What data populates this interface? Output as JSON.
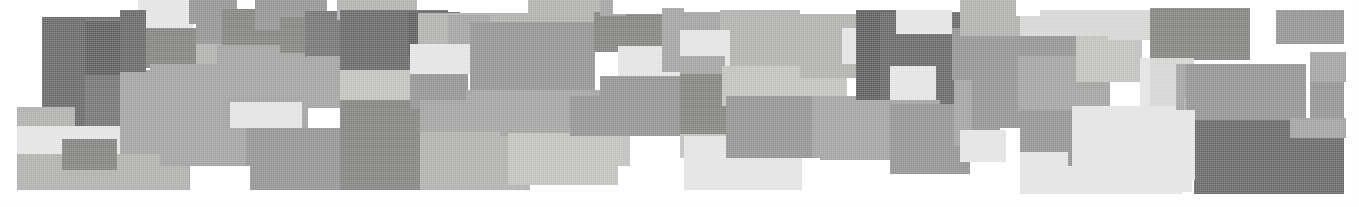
{
  "image": {
    "title": "Abstract grayscale rectangle mosaic band",
    "width": 1359,
    "height": 207,
    "background_color": "#ffffff",
    "description": "Horizontal band composed of overlapping solid grayscale rectangles of varying tone, resembling a scanned halftone pixel-mosaic graphic."
  },
  "palette": {
    "white": "#ffffff",
    "near_white": "#ececeb",
    "very_light_gray": "#e2e2e1",
    "light_gray": "#d3d3d2",
    "mid_light_gray": "#bdbdbc",
    "mid_gray": "#acacab",
    "gray": "#9d9d9c",
    "mid_dark_gray": "#8e8e8d",
    "dark_gray": "#7d7d7c",
    "darker_gray": "#6e6e6d",
    "very_dark_gray": "#626261",
    "charcoal": "#575756"
  },
  "blocks": [
    {
      "name": "block-01",
      "x": 42,
      "y": 17,
      "w": 78,
      "h": 122,
      "fill": "#626261"
    },
    {
      "name": "block-02",
      "x": 85,
      "y": 19,
      "w": 54,
      "h": 145,
      "fill": "#6e6e6d"
    },
    {
      "name": "block-03",
      "x": 85,
      "y": 21,
      "w": 53,
      "h": 54,
      "fill": "#575756"
    },
    {
      "name": "block-04",
      "x": 138,
      "y": 0,
      "w": 55,
      "h": 30,
      "fill": "#e2e2e1"
    },
    {
      "name": "block-05",
      "x": 138,
      "y": 28,
      "w": 78,
      "h": 40,
      "fill": "#7d7d7c"
    },
    {
      "name": "block-06",
      "x": 196,
      "y": 14,
      "w": 66,
      "h": 33,
      "fill": "#8e8e8d"
    },
    {
      "name": "block-07",
      "x": 196,
      "y": 44,
      "w": 122,
      "h": 62,
      "fill": "#acacab"
    },
    {
      "name": "block-08",
      "x": 17,
      "y": 107,
      "w": 58,
      "h": 46,
      "fill": "#acacab"
    },
    {
      "name": "block-09",
      "x": 17,
      "y": 126,
      "w": 118,
      "h": 48,
      "fill": "#e2e2e1"
    },
    {
      "name": "block-10",
      "x": 17,
      "y": 154,
      "w": 100,
      "h": 36,
      "fill": "#acacab"
    },
    {
      "name": "block-11",
      "x": 62,
      "y": 139,
      "w": 55,
      "h": 31,
      "fill": "#7d7d7c"
    },
    {
      "name": "block-12",
      "x": 120,
      "y": 70,
      "w": 79,
      "h": 95,
      "fill": "#9d9d9c"
    },
    {
      "name": "block-13",
      "x": 117,
      "y": 154,
      "w": 72,
      "h": 36,
      "fill": "#acacab"
    },
    {
      "name": "block-14",
      "x": 189,
      "y": 0,
      "w": 48,
      "h": 24,
      "fill": "#8e8e8d"
    },
    {
      "name": "block-15",
      "x": 222,
      "y": 9,
      "w": 66,
      "h": 36,
      "fill": "#7d7d7c"
    },
    {
      "name": "block-16",
      "x": 217,
      "y": 45,
      "w": 90,
      "h": 63,
      "fill": "#9d9d9c"
    },
    {
      "name": "block-17",
      "x": 160,
      "y": 96,
      "w": 148,
      "h": 70,
      "fill": "#9d9d9c"
    },
    {
      "name": "block-18",
      "x": 189,
      "y": 130,
      "w": 72,
      "h": 60,
      "fill": "#9d9d9c"
    },
    {
      "name": "block-19",
      "x": 230,
      "y": 102,
      "w": 72,
      "h": 26,
      "fill": "#e2e2e1"
    },
    {
      "name": "block-20",
      "x": 246,
      "y": 128,
      "w": 120,
      "h": 62,
      "fill": "#8e8e8d"
    },
    {
      "name": "block-21",
      "x": 190,
      "y": 166,
      "w": 60,
      "h": 24,
      "fill": "#ffffff"
    },
    {
      "name": "block-22",
      "x": 255,
      "y": 0,
      "w": 72,
      "h": 30,
      "fill": "#8e8e8d"
    },
    {
      "name": "block-23",
      "x": 280,
      "y": 17,
      "w": 66,
      "h": 36,
      "fill": "#7d7d7c"
    },
    {
      "name": "block-24",
      "x": 305,
      "y": 11,
      "w": 80,
      "h": 46,
      "fill": "#6e6e6d"
    },
    {
      "name": "block-25",
      "x": 307,
      "y": 56,
      "w": 110,
      "h": 52,
      "fill": "#9d9d9c"
    },
    {
      "name": "block-26",
      "x": 337,
      "y": 0,
      "w": 80,
      "h": 20,
      "fill": "#acacab"
    },
    {
      "name": "block-27",
      "x": 340,
      "y": 10,
      "w": 108,
      "h": 62,
      "fill": "#626261"
    },
    {
      "name": "block-28",
      "x": 408,
      "y": 12,
      "w": 52,
      "h": 44,
      "fill": "#575756"
    },
    {
      "name": "block-29",
      "x": 340,
      "y": 70,
      "w": 78,
      "h": 30,
      "fill": "#bdbdbc"
    },
    {
      "name": "block-30",
      "x": 340,
      "y": 100,
      "w": 80,
      "h": 90,
      "fill": "#7d7d7c"
    },
    {
      "name": "block-31",
      "x": 418,
      "y": 13,
      "w": 110,
      "h": 58,
      "fill": "#acacab"
    },
    {
      "name": "block-32",
      "x": 448,
      "y": 15,
      "w": 42,
      "h": 30,
      "fill": "#9d9d9c"
    },
    {
      "name": "block-33",
      "x": 410,
      "y": 44,
      "w": 70,
      "h": 30,
      "fill": "#e2e2e1"
    },
    {
      "name": "block-34",
      "x": 410,
      "y": 74,
      "w": 58,
      "h": 35,
      "fill": "#8e8e8d"
    },
    {
      "name": "block-35",
      "x": 420,
      "y": 100,
      "w": 150,
      "h": 36,
      "fill": "#9d9d9c"
    },
    {
      "name": "block-36",
      "x": 420,
      "y": 132,
      "w": 110,
      "h": 58,
      "fill": "#acacab"
    },
    {
      "name": "block-37",
      "x": 470,
      "y": 22,
      "w": 125,
      "h": 70,
      "fill": "#8e8e8d"
    },
    {
      "name": "block-38",
      "x": 500,
      "y": 90,
      "w": 112,
      "h": 46,
      "fill": "#9d9d9c"
    },
    {
      "name": "block-39",
      "x": 508,
      "y": 133,
      "w": 110,
      "h": 52,
      "fill": "#bdbdbc"
    },
    {
      "name": "block-40",
      "x": 528,
      "y": 0,
      "w": 86,
      "h": 22,
      "fill": "#acacab"
    },
    {
      "name": "block-41",
      "x": 594,
      "y": 12,
      "w": 70,
      "h": 40,
      "fill": "#7d7d7c"
    },
    {
      "name": "block-42",
      "x": 600,
      "y": 0,
      "w": 26,
      "h": 16,
      "fill": "#9d9d9c"
    },
    {
      "name": "block-43",
      "x": 613,
      "y": 0,
      "w": 52,
      "h": 14,
      "fill": "#ffffff"
    },
    {
      "name": "block-44",
      "x": 618,
      "y": 46,
      "w": 70,
      "h": 32,
      "fill": "#e2e2e1"
    },
    {
      "name": "block-45",
      "x": 600,
      "y": 76,
      "w": 125,
      "h": 60,
      "fill": "#8e8e8d"
    },
    {
      "name": "block-46",
      "x": 662,
      "y": 8,
      "w": 72,
      "h": 64,
      "fill": "#9d9d9c"
    },
    {
      "name": "block-47",
      "x": 684,
      "y": 0,
      "w": 50,
      "h": 12,
      "fill": "#ffffff"
    },
    {
      "name": "block-48",
      "x": 680,
      "y": 134,
      "w": 50,
      "h": 24,
      "fill": "#bdbdbc"
    },
    {
      "name": "block-49",
      "x": 684,
      "y": 136,
      "w": 118,
      "h": 54,
      "fill": "#e2e2e1"
    },
    {
      "name": "block-50",
      "x": 720,
      "y": 10,
      "w": 160,
      "h": 60,
      "fill": "#acacab"
    },
    {
      "name": "block-51",
      "x": 680,
      "y": 30,
      "w": 50,
      "h": 40,
      "fill": "#e2e2e1"
    },
    {
      "name": "block-52",
      "x": 680,
      "y": 56,
      "w": 45,
      "h": 22,
      "fill": "#9d9d9c"
    },
    {
      "name": "block-53",
      "x": 680,
      "y": 74,
      "w": 48,
      "h": 60,
      "fill": "#7d7d7c"
    },
    {
      "name": "block-54",
      "x": 722,
      "y": 66,
      "w": 125,
      "h": 40,
      "fill": "#bdbdbc"
    },
    {
      "name": "block-55",
      "x": 726,
      "y": 96,
      "w": 90,
      "h": 62,
      "fill": "#8e8e8d"
    },
    {
      "name": "block-56",
      "x": 800,
      "y": 28,
      "w": 96,
      "h": 50,
      "fill": "#acacab"
    },
    {
      "name": "block-57",
      "x": 800,
      "y": 0,
      "w": 60,
      "h": 14,
      "fill": "#ffffff"
    },
    {
      "name": "block-58",
      "x": 842,
      "y": 28,
      "w": 68,
      "h": 36,
      "fill": "#e2e2e1"
    },
    {
      "name": "block-59",
      "x": 812,
      "y": 96,
      "w": 120,
      "h": 62,
      "fill": "#9d9d9c"
    },
    {
      "name": "block-60",
      "x": 856,
      "y": 10,
      "w": 68,
      "h": 100,
      "fill": "#575756"
    },
    {
      "name": "block-61",
      "x": 880,
      "y": 12,
      "w": 100,
      "h": 96,
      "fill": "#626261"
    },
    {
      "name": "block-62",
      "x": 890,
      "y": 66,
      "w": 46,
      "h": 40,
      "fill": "#e2e2e1"
    },
    {
      "name": "block-63",
      "x": 820,
      "y": 100,
      "w": 120,
      "h": 60,
      "fill": "#9d9d9c"
    },
    {
      "name": "block-64",
      "x": 890,
      "y": 104,
      "w": 80,
      "h": 70,
      "fill": "#8e8e8d"
    },
    {
      "name": "block-65",
      "x": 896,
      "y": 10,
      "w": 56,
      "h": 24,
      "fill": "#e2e2e1"
    },
    {
      "name": "block-66",
      "x": 952,
      "y": 28,
      "w": 68,
      "h": 52,
      "fill": "#8e8e8d"
    },
    {
      "name": "block-67",
      "x": 954,
      "y": 80,
      "w": 66,
      "h": 66,
      "fill": "#9d9d9c"
    },
    {
      "name": "block-68",
      "x": 960,
      "y": 0,
      "w": 60,
      "h": 36,
      "fill": "#acacab"
    },
    {
      "name": "block-69",
      "x": 972,
      "y": 60,
      "w": 60,
      "h": 74,
      "fill": "#8e8e8d"
    },
    {
      "name": "block-70",
      "x": 1000,
      "y": 128,
      "w": 40,
      "h": 48,
      "fill": "#ffffff"
    },
    {
      "name": "block-71",
      "x": 1020,
      "y": 10,
      "w": 120,
      "h": 50,
      "fill": "#d3d3d2"
    },
    {
      "name": "block-72",
      "x": 1016,
      "y": 0,
      "w": 24,
      "h": 16,
      "fill": "#ffffff"
    },
    {
      "name": "block-73",
      "x": 1020,
      "y": 36,
      "w": 58,
      "h": 76,
      "fill": "#8e8e8d"
    },
    {
      "name": "block-74",
      "x": 1018,
      "y": 56,
      "w": 92,
      "h": 56,
      "fill": "#9d9d9c"
    },
    {
      "name": "block-75",
      "x": 1076,
      "y": 36,
      "w": 66,
      "h": 46,
      "fill": "#bdbdbc"
    },
    {
      "name": "block-76",
      "x": 1020,
      "y": 110,
      "w": 54,
      "h": 46,
      "fill": "#8e8e8d"
    },
    {
      "name": "block-77",
      "x": 1020,
      "y": 152,
      "w": 60,
      "h": 42,
      "fill": "#e2e2e1"
    },
    {
      "name": "block-78",
      "x": 1068,
      "y": 128,
      "w": 60,
      "h": 38,
      "fill": "#8e8e8d"
    },
    {
      "name": "block-79",
      "x": 1072,
      "y": 148,
      "w": 110,
      "h": 46,
      "fill": "#e2e2e1"
    },
    {
      "name": "block-80",
      "x": 1072,
      "y": 106,
      "w": 110,
      "h": 44,
      "fill": "#e2e2e1"
    },
    {
      "name": "block-81",
      "x": 1108,
      "y": 10,
      "w": 52,
      "h": 30,
      "fill": "#d3d3d2"
    },
    {
      "name": "block-82",
      "x": 1150,
      "y": 8,
      "w": 100,
      "h": 52,
      "fill": "#7d7d7c"
    },
    {
      "name": "block-83",
      "x": 1140,
      "y": 58,
      "w": 36,
      "h": 52,
      "fill": "#e2e2e1"
    },
    {
      "name": "block-84",
      "x": 1150,
      "y": 58,
      "w": 44,
      "h": 48,
      "fill": "#d3d3d2"
    },
    {
      "name": "block-85",
      "x": 1176,
      "y": 64,
      "w": 112,
      "h": 46,
      "fill": "#9d9d9c"
    },
    {
      "name": "block-86",
      "x": 1184,
      "y": 98,
      "w": 80,
      "h": 30,
      "fill": "#acacab"
    },
    {
      "name": "block-87",
      "x": 1186,
      "y": 64,
      "w": 120,
      "h": 56,
      "fill": "#8e8e8d"
    },
    {
      "name": "block-88",
      "x": 1194,
      "y": 120,
      "w": 150,
      "h": 74,
      "fill": "#626261"
    },
    {
      "name": "block-89",
      "x": 1276,
      "y": 10,
      "w": 68,
      "h": 34,
      "fill": "#8e8e8d"
    },
    {
      "name": "block-90",
      "x": 1310,
      "y": 60,
      "w": 34,
      "h": 64,
      "fill": "#8e8e8d"
    },
    {
      "name": "block-91",
      "x": 1310,
      "y": 52,
      "w": 36,
      "h": 30,
      "fill": "#9d9d9c"
    },
    {
      "name": "block-92",
      "x": 1155,
      "y": 110,
      "w": 40,
      "h": 70,
      "fill": "#e2e2e1"
    },
    {
      "name": "block-93",
      "x": 1140,
      "y": 150,
      "w": 52,
      "h": 42,
      "fill": "#e2e2e1"
    },
    {
      "name": "block-94",
      "x": 960,
      "y": 130,
      "w": 46,
      "h": 32,
      "fill": "#e2e2e1"
    },
    {
      "name": "block-95",
      "x": 600,
      "y": 136,
      "w": 30,
      "h": 30,
      "fill": "#bdbdbc"
    },
    {
      "name": "block-96",
      "x": 570,
      "y": 96,
      "w": 48,
      "h": 40,
      "fill": "#8e8e8d"
    },
    {
      "name": "block-97",
      "x": 466,
      "y": 90,
      "w": 60,
      "h": 26,
      "fill": "#9d9d9c"
    },
    {
      "name": "block-98",
      "x": 150,
      "y": 64,
      "w": 70,
      "h": 44,
      "fill": "#9d9d9c"
    },
    {
      "name": "block-99",
      "x": 120,
      "y": 10,
      "w": 26,
      "h": 62,
      "fill": "#626261"
    },
    {
      "name": "block-100",
      "x": 1290,
      "y": 118,
      "w": 56,
      "h": 20,
      "fill": "#9d9d9c"
    }
  ]
}
